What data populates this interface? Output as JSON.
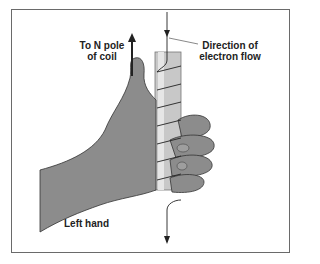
{
  "diagram": {
    "labels": {
      "north_pole_line1": "To N pole",
      "north_pole_line2": "of coil",
      "electron_flow_line1": "Direction of",
      "electron_flow_line2": "electron flow",
      "hand": "Left hand"
    },
    "colors": {
      "hand_fill": "#8c8c8c",
      "rod_fill": "#c8c8c8",
      "rod_highlight": "#e6e6e6",
      "outline": "#333333",
      "frame": "#6a6a6a"
    }
  }
}
